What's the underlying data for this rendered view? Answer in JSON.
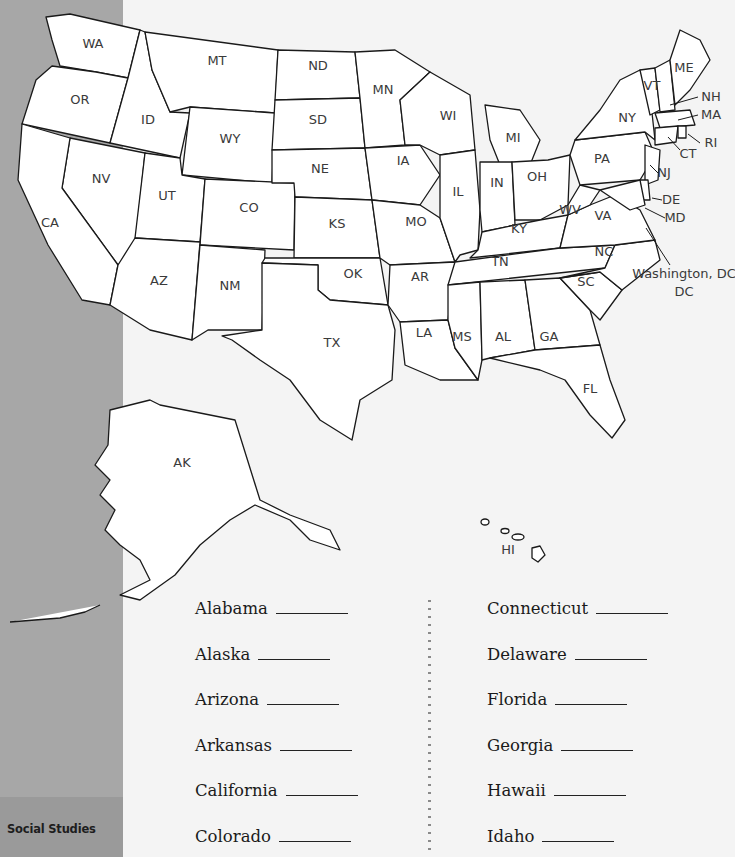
{
  "sidebar": {
    "label": "Social Studies",
    "color": "#a7a7a7"
  },
  "map": {
    "title": "United States",
    "states": [
      {
        "abbr": "WA",
        "x": 93,
        "y": 48,
        "points": "46,17 70,14 140,30 128,78 96,72 60,66 52,40"
      },
      {
        "abbr": "OR",
        "x": 80,
        "y": 104,
        "points": "52,66 96,72 128,78 110,143 22,124 36,80"
      },
      {
        "abbr": "ID",
        "x": 148,
        "y": 124,
        "points": "128,78 140,30 145,32 152,70 170,112 190,113 180,158 110,143"
      },
      {
        "abbr": "MT",
        "x": 217,
        "y": 65,
        "points": "145,32 278,50 275,113 190,107 170,112 152,70"
      },
      {
        "abbr": "WY",
        "x": 230,
        "y": 143,
        "points": "190,107 275,113 272,183 182,175"
      },
      {
        "abbr": "NV",
        "x": 101,
        "y": 183,
        "points": "70,138 145,153 135,248 118,265 62,188"
      },
      {
        "abbr": "UT",
        "x": 167,
        "y": 200,
        "points": "145,153 180,158 182,175 205,179 200,242 135,238"
      },
      {
        "abbr": "CO",
        "x": 249,
        "y": 212,
        "points": "205,179 295,183 294,250 200,245"
      },
      {
        "abbr": "CA",
        "x": 50,
        "y": 227,
        "points": "22,124 70,138 62,188 118,265 110,305 82,300 48,245 18,180"
      },
      {
        "abbr": "AZ",
        "x": 159,
        "y": 285,
        "points": "135,238 200,242 192,340 150,330 110,305 118,265"
      },
      {
        "abbr": "NM",
        "x": 230,
        "y": 290,
        "points": "200,245 265,250 262,330 208,330 192,340"
      },
      {
        "abbr": "ND",
        "x": 318,
        "y": 70,
        "points": "278,50 355,52 360,98 275,100"
      },
      {
        "abbr": "SD",
        "x": 318,
        "y": 124,
        "points": "275,100 360,98 365,148 272,150"
      },
      {
        "abbr": "NE",
        "x": 320,
        "y": 173,
        "points": "272,150 365,148 372,200 295,197 294,183 272,183"
      },
      {
        "abbr": "KS",
        "x": 337,
        "y": 228,
        "points": "295,197 372,200 380,258 294,258"
      },
      {
        "abbr": "OK",
        "x": 353,
        "y": 278,
        "points": "265,258 380,258 388,305 330,300 318,290 318,265 262,263"
      },
      {
        "abbr": "TX",
        "x": 332,
        "y": 347,
        "points": "262,263 318,265 318,290 330,300 388,305 395,330 392,380 360,400 352,440 320,420 290,380 260,360 232,340 222,336 262,330"
      },
      {
        "abbr": "MN",
        "x": 383,
        "y": 94,
        "points": "355,52 395,50 430,72 400,100 405,145 365,148 360,98"
      },
      {
        "abbr": "IA",
        "x": 403,
        "y": 165,
        "points": "365,148 420,145 440,175 420,205 372,200"
      },
      {
        "abbr": "MO",
        "x": 416,
        "y": 226,
        "points": "372,200 420,205 440,218 455,262 390,265 380,258"
      },
      {
        "abbr": "AR",
        "x": 420,
        "y": 281,
        "points": "390,265 455,262 448,320 400,322 388,305"
      },
      {
        "abbr": "LA",
        "x": 424,
        "y": 337,
        "points": "400,322 448,320 455,348 478,380 440,380 405,365"
      },
      {
        "abbr": "WI",
        "x": 448,
        "y": 120,
        "points": "400,100 430,72 470,95 475,150 440,155 420,145 405,145"
      },
      {
        "abbr": "IL",
        "x": 458,
        "y": 196,
        "points": "440,155 475,150 480,210 478,250 460,255 455,262 440,218 440,175"
      },
      {
        "abbr": "MI",
        "x": 513,
        "y": 142,
        "points": "485,105 520,110 540,140 530,165 500,165 490,140"
      },
      {
        "abbr": "IN",
        "x": 497,
        "y": 187,
        "points": "480,162 512,162 515,225 482,232 480,210"
      },
      {
        "abbr": "OH",
        "x": 537,
        "y": 181,
        "points": "512,162 548,160 570,155 568,205 540,220 515,220"
      },
      {
        "abbr": "KY",
        "x": 519,
        "y": 233,
        "points": "478,250 482,232 515,225 540,220 568,215 560,248 470,258"
      },
      {
        "abbr": "TN",
        "x": 500,
        "y": 266,
        "points": "455,262 560,248 615,245 605,268 448,285"
      },
      {
        "abbr": "MS",
        "x": 462,
        "y": 341,
        "points": "448,285 480,282 482,360 478,380 455,348 448,320"
      },
      {
        "abbr": "AL",
        "x": 503,
        "y": 341,
        "points": "480,282 525,280 535,350 490,358 482,360"
      },
      {
        "abbr": "GA",
        "x": 549,
        "y": 341,
        "points": "525,280 560,278 590,310 600,345 535,350"
      },
      {
        "abbr": "FL",
        "x": 590,
        "y": 393,
        "points": "490,358 535,350 600,345 610,380 625,420 612,438 590,415 565,380 540,370"
      },
      {
        "abbr": "SC",
        "x": 586,
        "y": 286,
        "points": "560,278 600,272 622,290 600,320 590,310"
      },
      {
        "abbr": "NC",
        "x": 604,
        "y": 256,
        "points": "605,268 615,245 655,240 660,260 622,290 600,272 560,278"
      },
      {
        "abbr": "VA",
        "x": 603,
        "y": 220,
        "points": "560,248 568,215 590,205 615,195 640,210 655,240 615,245"
      },
      {
        "abbr": "WV",
        "x": 570,
        "y": 214,
        "points": "568,205 580,185 600,190 590,205 568,215"
      },
      {
        "abbr": "PA",
        "x": 602,
        "y": 163,
        "points": "570,155 575,140 645,132 655,155 640,180 580,185"
      },
      {
        "abbr": "NY",
        "x": 627,
        "y": 122,
        "points": "575,140 600,110 620,80 640,70 650,95 655,140 645,132"
      },
      {
        "abbr": "NJ",
        "x": 650,
        "y": 170,
        "points": "645,145 660,150 658,180 645,185"
      },
      {
        "abbr": "DE",
        "x": 648,
        "y": 198,
        "points": "640,180 648,180 650,200 642,200"
      },
      {
        "abbr": "MD",
        "x": 628,
        "y": 200,
        "points": "600,190 640,180 645,205 630,210"
      },
      {
        "abbr": "VT",
        "x": 652,
        "y": 90,
        "points": "640,70 655,68 660,110 650,115"
      },
      {
        "abbr": "NH",
        "x": 665,
        "y": 100,
        "points": "655,68 670,60 675,110 660,112"
      },
      {
        "abbr": "ME",
        "x": 684,
        "y": 72,
        "points": "670,60 680,30 700,40 710,60 690,90 675,105"
      },
      {
        "abbr": "MA",
        "x": 670,
        "y": 121,
        "points": "655,113 690,110 695,125 660,128"
      },
      {
        "abbr": "CT",
        "x": 665,
        "y": 135,
        "points": "655,128 678,126 676,142 655,145"
      },
      {
        "abbr": "RI",
        "x": 681,
        "y": 133,
        "points": "678,126 686,126 686,138 678,138"
      }
    ],
    "callouts": [
      {
        "abbr": "NH",
        "label_x": 711,
        "label_y": 101,
        "line": "670,105 698,97"
      },
      {
        "abbr": "MA",
        "label_x": 711,
        "label_y": 119,
        "line": "678,120 698,115"
      },
      {
        "abbr": "RI",
        "label_x": 711,
        "label_y": 147,
        "line": "688,134 700,143"
      },
      {
        "abbr": "CT",
        "label_x": 688,
        "label_y": 158,
        "line": "668,137 680,150"
      },
      {
        "abbr": "NJ",
        "label_x": 664,
        "label_y": 177,
        "line": "650,165 658,173"
      },
      {
        "abbr": "DE",
        "label_x": 671,
        "label_y": 204,
        "line": "652,198 662,200"
      },
      {
        "abbr": "MD",
        "label_x": 675,
        "label_y": 222,
        "line": "645,208 665,218"
      },
      {
        "abbr": "Washington, DC",
        "label_x": 684,
        "label_y": 278,
        "line": "646,228 670,265"
      }
    ],
    "dc_label_line2": "DC",
    "alaska": {
      "abbr": "AK",
      "x": 182,
      "y": 467
    },
    "hawaii": {
      "abbr": "HI",
      "x": 508,
      "y": 554
    }
  },
  "worksheet": {
    "left_column": [
      {
        "state": "Alabama",
        "blank_width": 72
      },
      {
        "state": "Alaska",
        "blank_width": 72
      },
      {
        "state": "Arizona",
        "blank_width": 72
      },
      {
        "state": "Arkansas",
        "blank_width": 72
      },
      {
        "state": "California",
        "blank_width": 72
      },
      {
        "state": "Colorado",
        "blank_width": 72
      }
    ],
    "right_column": [
      {
        "state": "Connecticut",
        "blank_width": 72
      },
      {
        "state": "Delaware",
        "blank_width": 72
      },
      {
        "state": "Florida",
        "blank_width": 72
      },
      {
        "state": "Georgia",
        "blank_width": 72
      },
      {
        "state": "Hawaii",
        "blank_width": 72
      },
      {
        "state": "Idaho",
        "blank_width": 72
      }
    ]
  }
}
